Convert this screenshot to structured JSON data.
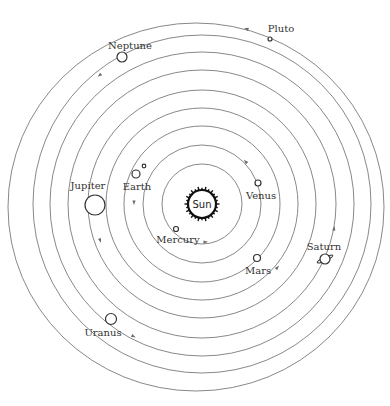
{
  "diagram": {
    "center": {
      "x": 202,
      "y": 204
    },
    "colors": {
      "orbit": "#7a7a7a",
      "planet_stroke": "#333333",
      "sun_stroke": "#111111",
      "label": "#333333"
    },
    "sun": {
      "label": "Sun",
      "radius": 14
    },
    "planets": [
      {
        "name": "Mercury",
        "label": "Mercury",
        "orbit_r": 40,
        "x": 176,
        "y": 229,
        "r": 2.5,
        "lx": 178,
        "ly": 243
      },
      {
        "name": "Venus",
        "label": "Venus",
        "orbit_r": 59,
        "x": 258,
        "y": 183,
        "r": 3,
        "lx": 261,
        "ly": 199
      },
      {
        "name": "Earth",
        "label": "Earth",
        "orbit_r": 78,
        "x": 136,
        "y": 174,
        "r": 4,
        "lx": 137,
        "ly": 190,
        "moon": {
          "x": 144,
          "y": 166,
          "r": 1.8
        }
      },
      {
        "name": "Mars",
        "label": "Mars",
        "orbit_r": 96,
        "x": 257,
        "y": 258,
        "r": 3.5,
        "lx": 258,
        "ly": 274
      },
      {
        "name": "Jupiter",
        "label": "Jupiter",
        "orbit_r": 114,
        "x": 95,
        "y": 205,
        "r": 10,
        "lx": 88,
        "ly": 189
      },
      {
        "name": "Saturn",
        "label": "Saturn",
        "orbit_r": 134,
        "x": 325,
        "y": 259,
        "r": 5,
        "lx": 324,
        "ly": 250,
        "ring": true
      },
      {
        "name": "Uranus",
        "label": "Uranus",
        "orbit_r": 152,
        "x": 111,
        "y": 319,
        "r": 5.5,
        "lx": 103,
        "ly": 336
      },
      {
        "name": "Neptune",
        "label": "Neptune",
        "orbit_r": 169,
        "x": 122,
        "y": 57,
        "r": 5,
        "lx": 130,
        "ly": 49
      },
      {
        "name": "Pluto",
        "label": "Pluto",
        "orbit_r": 186,
        "x": 270,
        "y": 39,
        "r": 2,
        "lx": 281,
        "ly": 32,
        "eccentric": true
      }
    ],
    "arrows": [
      {
        "orbit": "Mercury",
        "x": 205,
        "y": 242
      },
      {
        "orbit": "Venus",
        "x": 246,
        "y": 162
      },
      {
        "orbit": "Earth",
        "x": 134,
        "y": 202
      },
      {
        "orbit": "Mars",
        "x": 277,
        "y": 268
      },
      {
        "orbit": "Jupiter",
        "x": 100,
        "y": 240
      },
      {
        "orbit": "Saturn",
        "x": 334,
        "y": 229
      },
      {
        "orbit": "Uranus",
        "x": 133,
        "y": 336
      },
      {
        "orbit": "Neptune",
        "x": 100,
        "y": 75
      },
      {
        "orbit": "Pluto",
        "x": 247,
        "y": 29
      }
    ]
  }
}
